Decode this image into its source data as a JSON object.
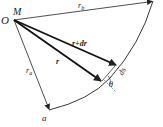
{
  "diagram": {
    "labels": {
      "origin": "O",
      "point_m": "M",
      "rb_main": "r",
      "rb_sub": "b",
      "ra_main": "r",
      "ra_sub": "a",
      "r": "r",
      "r_dr": "r+dr",
      "ds": "ds",
      "theta": "θ",
      "a": "a"
    },
    "colors": {
      "line": "#222222",
      "background": "#ffffff"
    }
  }
}
